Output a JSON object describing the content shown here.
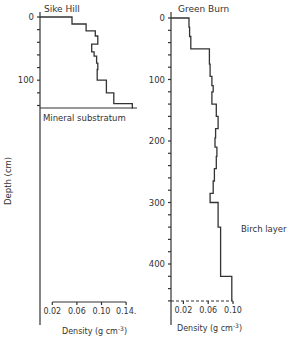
{
  "chart_data": [
    {
      "type": "line",
      "subtype": "step-profile",
      "title": "Sike Hill",
      "xlabel": "Density (g cm-3)",
      "ylabel": "Depth (cm)",
      "x_ticks": [
        "0.02",
        "0.06",
        "0.10",
        "0.14"
      ],
      "y_ticks": [
        "0",
        "100"
      ],
      "xlim": [
        0,
        0.16
      ],
      "ylim": [
        0,
        145
      ],
      "y_inverted": true,
      "annotation": "Mineral substratum",
      "annotation_depth": 145,
      "steps": [
        {
          "depth_top": 0,
          "depth_bottom": 11,
          "density": 0.052
        },
        {
          "depth_top": 11,
          "depth_bottom": 22,
          "density": 0.075
        },
        {
          "depth_top": 22,
          "depth_bottom": 30,
          "density": 0.09
        },
        {
          "depth_top": 30,
          "depth_bottom": 43,
          "density": 0.094
        },
        {
          "depth_top": 43,
          "depth_bottom": 55,
          "density": 0.084
        },
        {
          "depth_top": 55,
          "depth_bottom": 62,
          "density": 0.088
        },
        {
          "depth_top": 62,
          "depth_bottom": 73,
          "density": 0.092
        },
        {
          "depth_top": 73,
          "depth_bottom": 83,
          "density": 0.094
        },
        {
          "depth_top": 83,
          "depth_bottom": 100,
          "density": 0.093
        },
        {
          "depth_top": 100,
          "depth_bottom": 120,
          "density": 0.108
        },
        {
          "depth_top": 120,
          "depth_bottom": 137,
          "density": 0.12
        },
        {
          "depth_top": 137,
          "depth_bottom": 145,
          "density": 0.15
        }
      ]
    },
    {
      "type": "line",
      "subtype": "step-profile",
      "title": "Green Burn",
      "xlabel": "Density (g cm-3)",
      "ylabel": "Depth (cm)",
      "x_ticks": [
        "0.02",
        "0.06",
        "0.10"
      ],
      "y_ticks": [
        "0",
        "100",
        "200",
        "300",
        "400"
      ],
      "xlim": [
        0,
        0.11
      ],
      "ylim": [
        0,
        460
      ],
      "y_inverted": true,
      "annotation": "Birch layer",
      "annotation_depth": 340,
      "steps": [
        {
          "depth_top": 0,
          "depth_bottom": 15,
          "density": 0.029
        },
        {
          "depth_top": 15,
          "depth_bottom": 30,
          "density": 0.03
        },
        {
          "depth_top": 30,
          "depth_bottom": 50,
          "density": 0.032
        },
        {
          "depth_top": 50,
          "depth_bottom": 75,
          "density": 0.062
        },
        {
          "depth_top": 75,
          "depth_bottom": 95,
          "density": 0.063
        },
        {
          "depth_top": 95,
          "depth_bottom": 110,
          "density": 0.066
        },
        {
          "depth_top": 110,
          "depth_bottom": 120,
          "density": 0.068
        },
        {
          "depth_top": 120,
          "depth_bottom": 140,
          "density": 0.066
        },
        {
          "depth_top": 140,
          "depth_bottom": 160,
          "density": 0.073
        },
        {
          "depth_top": 160,
          "depth_bottom": 180,
          "density": 0.076
        },
        {
          "depth_top": 180,
          "depth_bottom": 195,
          "density": 0.072
        },
        {
          "depth_top": 195,
          "depth_bottom": 210,
          "density": 0.071
        },
        {
          "depth_top": 210,
          "depth_bottom": 225,
          "density": 0.074
        },
        {
          "depth_top": 225,
          "depth_bottom": 245,
          "density": 0.073
        },
        {
          "depth_top": 245,
          "depth_bottom": 265,
          "density": 0.07
        },
        {
          "depth_top": 265,
          "depth_bottom": 285,
          "density": 0.068
        },
        {
          "depth_top": 285,
          "depth_bottom": 300,
          "density": 0.063
        },
        {
          "depth_top": 300,
          "depth_bottom": 340,
          "density": 0.076
        },
        {
          "depth_top": 340,
          "depth_bottom": 420,
          "density": 0.08
        },
        {
          "depth_top": 420,
          "depth_bottom": 460,
          "density": 0.098
        }
      ]
    }
  ],
  "labels": {
    "sike_title": "Sike Hill",
    "green_title": "Green Burn",
    "y_axis_label": "Depth (cm)",
    "mineral": "Mineral substratum",
    "birch": "Birch layer",
    "density_label": "Density (g cm",
    "density_exp": "-3",
    "density_close": ")",
    "sike_yticks": [
      "0",
      "100"
    ],
    "green_yticks": [
      "0",
      "100",
      "200",
      "300",
      "400"
    ],
    "sike_xticks": [
      "0.02",
      "0.06",
      "0.10",
      "0.14."
    ],
    "green_xticks": [
      "0.02",
      "0.06",
      "0.10"
    ]
  }
}
